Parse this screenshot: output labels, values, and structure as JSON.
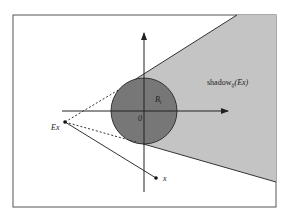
{
  "figure": {
    "labels": {
      "shadow_main": "shadow",
      "shadow_sub": "t",
      "shadow_sub2": "j",
      "shadow_arg": "(Ex)",
      "ball": "B",
      "ball_sub": "t",
      "origin": "0",
      "ex_point": "Ex",
      "x_point": "x"
    },
    "colors": {
      "background": "#ffffff",
      "frame": "#555555",
      "shadow_fill": "#c4c4c4",
      "ball_fill": "#777777",
      "ball_stroke": "#333333",
      "axis": "#222222",
      "line": "#333333"
    },
    "geometry": {
      "frame": {
        "x": 13,
        "y": 15,
        "w": 263,
        "h": 192
      },
      "ball": {
        "cx": 144,
        "cy": 111,
        "r": 33
      },
      "ex": {
        "x": 65,
        "y": 122
      },
      "x": {
        "x": 156,
        "y": 178
      }
    }
  }
}
